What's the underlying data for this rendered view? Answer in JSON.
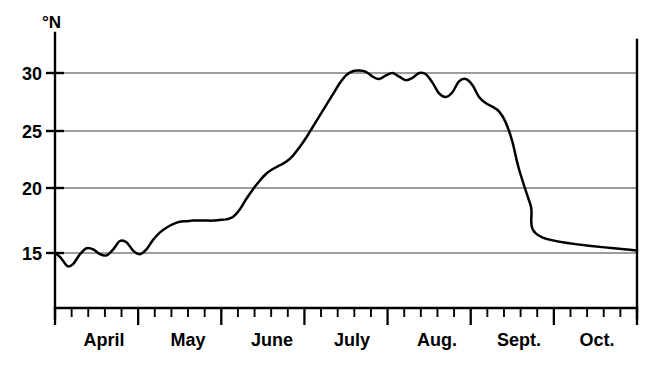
{
  "chart_data": {
    "type": "line",
    "title": "",
    "subtitle": "",
    "xlabel": "",
    "ylabel": "°N",
    "ylim": [
      12.5,
      32.5
    ],
    "yticks": [
      15,
      20,
      25,
      30
    ],
    "ytick_labels": [
      "15",
      "20",
      "25",
      "30"
    ],
    "grid": true,
    "grid_axis": "y",
    "legend": "none",
    "xlim": [
      "April",
      "Oct."
    ],
    "categories": [
      "April",
      "May",
      "June",
      "July",
      "Aug.",
      "Sept.",
      "Oct."
    ],
    "xtick_labels": [
      "April",
      "May",
      "June",
      "July",
      "Aug.",
      "Sept.",
      "Oct."
    ],
    "minor_ticks_per_month": 5,
    "series": [
      {
        "name": "latitude",
        "units": "°N",
        "x": [
          0.0,
          0.35,
          0.75,
          1.1,
          1.5,
          1.9,
          2.3,
          2.7,
          3.1,
          3.5,
          3.9,
          4.3,
          4.7,
          5.1,
          5.5,
          5.9,
          6.3,
          6.7,
          7.1,
          7.5,
          7.9,
          8.3,
          8.7,
          9.1,
          9.5,
          9.9,
          10.3,
          10.7,
          11.1,
          11.5,
          11.9,
          12.3,
          12.7,
          13.1,
          13.5,
          13.9,
          14.3,
          14.7,
          15.1,
          15.5,
          15.9,
          16.3,
          16.7,
          17.1,
          17.5,
          17.9,
          18.3,
          18.7,
          19.1,
          19.5,
          19.9,
          20.3,
          20.7,
          21.1,
          21.5,
          21.9,
          22.3,
          22.7,
          23.1,
          23.5,
          23.9,
          24.3,
          24.7,
          25.1,
          25.5,
          25.9,
          26.3,
          26.7,
          27.1,
          27.5,
          27.9
        ],
        "values": [
          15.0,
          14.6,
          13.9,
          14.1,
          14.9,
          15.4,
          15.3,
          14.9,
          14.8,
          15.3,
          16.0,
          15.9,
          15.2,
          14.9,
          15.3,
          16.1,
          16.7,
          17.1,
          17.4,
          17.6,
          17.65,
          17.7,
          17.7,
          17.7,
          17.7,
          17.75,
          17.8,
          18.0,
          18.6,
          19.5,
          20.3,
          21.0,
          21.6,
          22.0,
          22.3,
          22.6,
          23.1,
          23.8,
          24.6,
          25.5,
          26.4,
          27.3,
          28.2,
          29.1,
          29.8,
          30.15,
          30.2,
          30.1,
          29.7,
          29.5,
          29.8,
          30.0,
          29.7,
          29.4,
          29.6,
          30.0,
          29.9,
          29.2,
          28.3,
          28.0,
          28.4,
          29.3,
          29.5,
          29.0,
          28.0,
          27.5,
          27.2,
          26.8,
          25.9,
          24.3,
          22.0
        ],
        "peak_value": 30.2,
        "min_value": 13.9,
        "end_value": 15.2
      }
    ],
    "annotations": []
  }
}
